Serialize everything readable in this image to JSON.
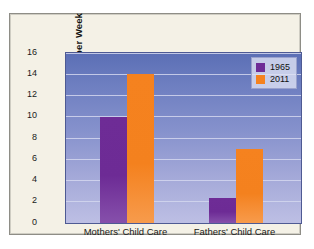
{
  "chart_data": {
    "type": "bar",
    "title": "",
    "xlabel": "",
    "ylabel": "Mean Hours per Week",
    "categories": [
      "Mothers' Child Care",
      "Fathers' Child Care"
    ],
    "series": [
      {
        "name": "1965",
        "color": "#6e2c96",
        "values": [
          10,
          2.4
        ]
      },
      {
        "name": "2011",
        "color": "#f5821f",
        "values": [
          14,
          7
        ]
      }
    ],
    "ylim": [
      0,
      16
    ],
    "ytick_values": [
      0,
      2,
      4,
      6,
      8,
      10,
      12,
      14,
      16
    ],
    "ytick_labels": [
      "0",
      "2",
      "4",
      "6",
      "8",
      "10",
      "12",
      "14",
      "16"
    ],
    "grid": true,
    "legend_position": "top-right"
  },
  "legend": {
    "items": [
      {
        "label": "1965",
        "swatch": "purple-swatch-icon"
      },
      {
        "label": "2011",
        "swatch": "orange-swatch-icon"
      }
    ]
  },
  "axis": {
    "y_title": "Mean Hours per Week",
    "y_labels": [
      "16",
      "14",
      "12",
      "10",
      "8",
      "6",
      "4",
      "2",
      "0"
    ],
    "x_labels": [
      "Mothers' Child Care",
      "Fathers' Child Care"
    ]
  },
  "colors": {
    "series_1965": "#6e2c96",
    "series_2011": "#f5821f",
    "plot_background_top": "#5b6fb5",
    "plot_background_bottom": "#bdbfe4",
    "card_background": "#f4f1e6",
    "gridline": "#d3d7ee"
  }
}
